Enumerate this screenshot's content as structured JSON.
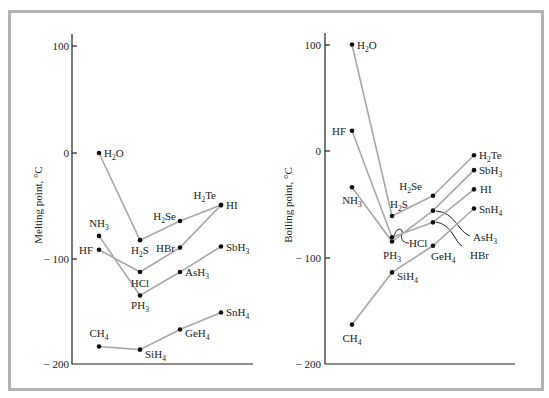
{
  "chart_data": [
    {
      "type": "line",
      "title": "",
      "ylabel": "Melting point, °C",
      "xlabel": "",
      "ylim": [
        -200,
        100
      ],
      "yticks": [
        100,
        0,
        -100,
        -200
      ],
      "grid": false,
      "legend": "none (direct labels)",
      "x_positions": [
        "Period 2",
        "Period 3",
        "Period 4",
        "Period 5"
      ],
      "series": [
        {
          "name": "Group 14",
          "labels": [
            "CH4",
            "SiH4",
            "GeH4",
            "SnH4"
          ],
          "values": [
            -182,
            -185,
            -166,
            -150
          ]
        },
        {
          "name": "Group 15",
          "labels": [
            "NH3",
            "PH3",
            "AsH3",
            "SbH3"
          ],
          "values": [
            -78,
            -134,
            -112,
            -88
          ]
        },
        {
          "name": "Group 16",
          "labels": [
            "H2O",
            "H2S",
            "H2Se",
            "H2Te"
          ],
          "values": [
            0,
            -82,
            -64,
            -49
          ]
        },
        {
          "name": "Group 17",
          "labels": [
            "HF",
            "HCl",
            "HBr",
            "HI"
          ],
          "values": [
            -91,
            -112,
            -89,
            -49
          ]
        }
      ]
    },
    {
      "type": "line",
      "title": "",
      "ylabel": "Boiling point, °C",
      "xlabel": "",
      "ylim": [
        -200,
        100
      ],
      "yticks": [
        100,
        0,
        -100,
        -200
      ],
      "grid": false,
      "legend": "none (direct labels)",
      "x_positions": [
        "Period 2",
        "Period 3",
        "Period 4",
        "Period 5"
      ],
      "series": [
        {
          "name": "Group 14",
          "labels": [
            "CH4",
            "SiH4",
            "GeH4",
            "SnH4"
          ],
          "values": [
            -163,
            -114,
            -89,
            -54
          ]
        },
        {
          "name": "Group 15",
          "labels": [
            "NH3",
            "PH3",
            "AsH3",
            "SbH3"
          ],
          "values": [
            -34,
            -85,
            -56,
            -18
          ]
        },
        {
          "name": "Group 16",
          "labels": [
            "H2O",
            "H2S",
            "H2Se",
            "H2Te"
          ],
          "values": [
            100,
            -61,
            -42,
            -4
          ]
        },
        {
          "name": "Group 17",
          "labels": [
            "HF",
            "HCl",
            "HBr",
            "HI"
          ],
          "values": [
            19,
            -81,
            -67,
            -36
          ]
        }
      ]
    }
  ],
  "left_chart": {
    "ylabel": "Melting point, °C",
    "ticks": [
      "100",
      "0",
      "− 100",
      "− 200"
    ]
  },
  "right_chart": {
    "ylabel": "Boiling point, °C",
    "ticks": [
      "100",
      "0",
      "− 100",
      "− 200"
    ]
  },
  "labels": {
    "H2O": [
      "H",
      "2",
      "O"
    ],
    "H2S": [
      "H",
      "2",
      "S"
    ],
    "H2Se": [
      "H",
      "2",
      "Se"
    ],
    "H2Te": [
      "H",
      "2",
      "Te"
    ],
    "NH3": [
      "NH",
      "3",
      ""
    ],
    "PH3": [
      "PH",
      "3",
      ""
    ],
    "AsH3": [
      "AsH",
      "3",
      ""
    ],
    "SbH3": [
      "SbH",
      "3",
      ""
    ],
    "CH4": [
      "CH",
      "4",
      ""
    ],
    "SiH4": [
      "SiH",
      "4",
      ""
    ],
    "GeH4": [
      "GeH",
      "4",
      ""
    ],
    "SnH4": [
      "SnH",
      "4",
      ""
    ],
    "HF": [
      "HF",
      "",
      ""
    ],
    "HCl": [
      "HCl",
      "",
      ""
    ],
    "HBr": [
      "HBr",
      "",
      ""
    ],
    "HI": [
      "HI",
      "",
      ""
    ]
  },
  "colors": {
    "line": "#a8a8a8",
    "point": "#111111",
    "frame": "#b4b4b4",
    "axis": "#222222"
  }
}
